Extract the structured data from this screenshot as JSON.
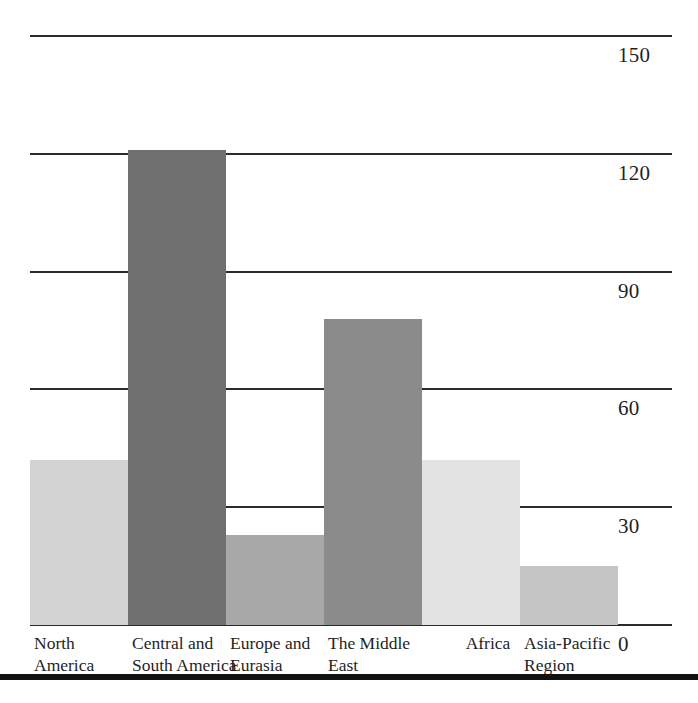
{
  "chart_data": {
    "type": "bar",
    "title": "",
    "subtitle": "",
    "xlabel": "",
    "ylabel": "",
    "categories": [
      "North\nAmerica",
      "Central and\nSouth America",
      "Europe and\nEurasia",
      "The Middle\nEast",
      "Africa",
      "Asia-Pacific\nRegion"
    ],
    "values": [
      42,
      121,
      23,
      78,
      42,
      15
    ],
    "ylim": [
      0,
      150
    ],
    "yticks": [
      0,
      30,
      60,
      90,
      120,
      150
    ],
    "ytick_labels": [
      "0",
      "30",
      "60",
      "90",
      "120",
      "150"
    ],
    "grid": true,
    "legend": false,
    "bar_colors": [
      "#d3d3d3",
      "#6f6f6f",
      "#a8a8a8",
      "#8b8b8b",
      "#e3e3e3",
      "#c5c5c5"
    ],
    "axis_color": "#2b2b2b",
    "text_color": "#1f1f1f",
    "background": "#ffffff"
  },
  "axis": {
    "y_tick_labels": [
      "150",
      "120",
      "90",
      "60",
      "30",
      "0"
    ]
  },
  "bars": [
    {
      "label": "North\nAmerica",
      "value": 42,
      "color": "#d3d3d3"
    },
    {
      "label": "Central and\nSouth America",
      "value": 121,
      "color": "#6f6f6f"
    },
    {
      "label": "Europe and\nEurasia",
      "value": 23,
      "color": "#a8a8a8"
    },
    {
      "label": "The Middle\nEast",
      "value": 78,
      "color": "#8b8b8b"
    },
    {
      "label": "Africa",
      "value": 42,
      "color": "#e3e3e3"
    },
    {
      "label": "Asia-Pacific\nRegion",
      "value": 15,
      "color": "#c5c5c5"
    }
  ]
}
